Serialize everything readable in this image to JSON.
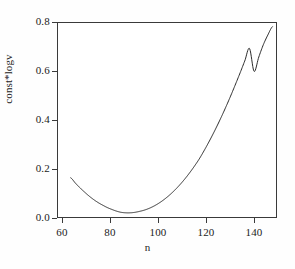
{
  "chart_data": {
    "type": "line",
    "title": "",
    "subtitle": "",
    "xlabel": "n",
    "ylabel": "const*logv",
    "xlim": [
      54,
      150
    ],
    "ylim": [
      -0.02,
      0.81
    ],
    "xticks": [
      60,
      80,
      100,
      120,
      140
    ],
    "xticklabels": [
      "60",
      "80",
      "100",
      "120",
      "140"
    ],
    "yticks": [
      0.0,
      0.2,
      0.4,
      0.6,
      0.8
    ],
    "yticklabels": [
      "0.0",
      "0.2",
      "0.4",
      "0.6",
      "0.8"
    ],
    "grid": false,
    "legend": null,
    "annotations": [],
    "series": [
      {
        "name": "const*logv",
        "color": "#2b2b2b",
        "linewidth": 1,
        "x": [
          60,
          62,
          64,
          66,
          68,
          70,
          72,
          74,
          76,
          78,
          80,
          82,
          84,
          86,
          88,
          90,
          92,
          94,
          96,
          98,
          100,
          102,
          104,
          106,
          108,
          110,
          112,
          114,
          116,
          118,
          120,
          122,
          124,
          126,
          128,
          130,
          132,
          134,
          136,
          138,
          140,
          142,
          144,
          146,
          148
        ],
        "y": [
          0.15,
          0.128,
          0.108,
          0.09,
          0.073,
          0.058,
          0.045,
          0.034,
          0.024,
          0.016,
          0.009,
          0.004,
          0.002,
          0.002,
          0.004,
          0.008,
          0.013,
          0.02,
          0.029,
          0.04,
          0.053,
          0.068,
          0.085,
          0.104,
          0.125,
          0.148,
          0.173,
          0.2,
          0.229,
          0.262,
          0.297,
          0.334,
          0.373,
          0.414,
          0.457,
          0.502,
          0.549,
          0.597,
          0.647,
          0.698,
          0.601,
          0.66,
          0.713,
          0.755,
          0.79
        ]
      }
    ]
  },
  "axes": {
    "xticks": [
      {
        "label": "60",
        "value": 60
      },
      {
        "label": "80",
        "value": 80
      },
      {
        "label": "100",
        "value": 100
      },
      {
        "label": "120",
        "value": 120
      },
      {
        "label": "140",
        "value": 140
      }
    ],
    "yticks": [
      {
        "label": "0.8",
        "value": 0.8
      },
      {
        "label": "0.6",
        "value": 0.6
      },
      {
        "label": "0.4",
        "value": 0.4
      },
      {
        "label": "0.2",
        "value": 0.2
      },
      {
        "label": "0.0",
        "value": 0.0
      }
    ],
    "xlabel": "n",
    "ylabel": "const*logv"
  },
  "colors": {
    "background": "#ffffff",
    "axis": "#3a3a3a",
    "curve": "#2b2b2b",
    "text": "#222222"
  }
}
